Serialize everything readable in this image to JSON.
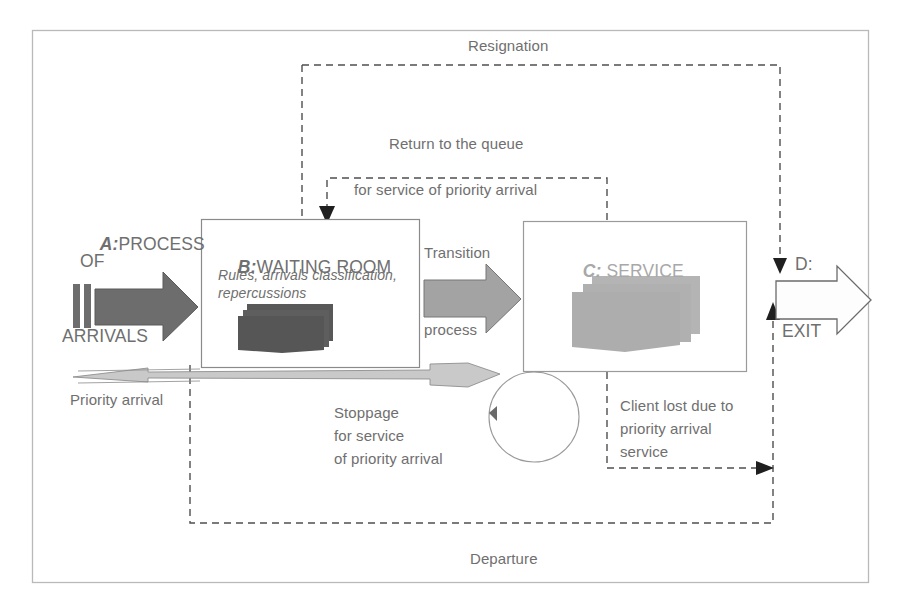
{
  "diagram": {
    "outer_frame": {
      "border_color": "#b9b9b9"
    },
    "colors": {
      "text_gray": "#6f6f6f",
      "text_light_gray": "#a8a8a8",
      "arrow_dark": "#6a6a6a",
      "arrow_mid": "#9a9a9a",
      "arrow_light": "#c6c6c6",
      "doc_dark": "#5e5e5e",
      "doc_light": "#b0b0b0",
      "dashed_line": "#555555",
      "box_border": "#8a8a8a"
    },
    "stages": [
      {
        "id": "A",
        "tag": "A:",
        "title_line1": "PROCESS",
        "title_line2": "OF",
        "title_line3": "ARRIVALS",
        "shape": "block-arrow-right",
        "shade": "dark"
      },
      {
        "id": "B",
        "tag": "B:",
        "title": "WAITING ROOM",
        "subtitle": "Rules, arrivals classification,\nrepercussions",
        "shape": "box",
        "shade": "dark-documents"
      },
      {
        "id": "C",
        "tag": "C:",
        "title": "SERVICE",
        "shape": "box",
        "shade": "light-documents"
      },
      {
        "id": "D",
        "tag": "D:",
        "title": "EXIT",
        "shape": "block-arrow-right",
        "shade": "white"
      }
    ],
    "connector_labels": {
      "transition_line1": "Transition",
      "transition_line2": "process",
      "resignation": "Resignation",
      "return_to_queue_line1": "Return to the queue",
      "return_to_queue_line2": "for service of priority arrival",
      "priority_arrival": "Priority arrival",
      "stoppage_line1": "Stoppage",
      "stoppage_line2": "for service",
      "stoppage_line3": "of priority arrival",
      "client_lost_line1": "Client lost due to",
      "client_lost_line2": "priority arrival",
      "client_lost_line3": "service",
      "departure": "Departure"
    },
    "icons": {
      "loop": "circular-loop-icon",
      "documents_waiting": "document-stack-icon",
      "documents_service": "document-stack-icon",
      "queue_bars": "queue-bars-icon"
    }
  }
}
